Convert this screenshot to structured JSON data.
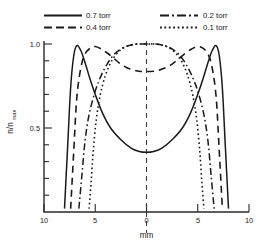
{
  "chart_data": {
    "type": "line",
    "title": "",
    "xlabel": "mm",
    "ylabel": "n/n max",
    "ylabel_main": "n/n",
    "ylabel_sub": "max",
    "xlim": [
      -10,
      10
    ],
    "ylim": [
      0,
      1.08
    ],
    "grid": false,
    "legend_position": "top",
    "x_ticks": [
      -10,
      -5,
      0,
      5,
      10
    ],
    "x_tick_labels": [
      "10",
      "5",
      "0",
      "5",
      "10"
    ],
    "y_ticks": [
      0.5,
      1.0
    ],
    "y_tick_labels": [
      "0.5",
      "1.0"
    ],
    "y_minor_ticks": [
      0.1,
      0.2,
      0.3,
      0.4,
      0.6,
      0.7,
      0.8,
      0.9
    ],
    "center_line_x": 0,
    "series": [
      {
        "name": "0.7 torr",
        "style": "solid",
        "shape": "double-peaked hollow profile",
        "x": [
          -8.0,
          -7.7,
          -7.4,
          -7.1,
          -6.8,
          -6.4,
          -6.0,
          -5.5,
          -5.0,
          -4.3,
          -3.5,
          -2.5,
          -1.5,
          -0.7,
          0.0,
          0.7,
          1.5,
          2.5,
          3.5,
          4.3,
          5.0,
          5.5,
          6.0,
          6.4,
          6.8,
          7.1,
          7.4,
          7.7,
          8.0
        ],
        "y": [
          0.02,
          0.38,
          0.74,
          0.93,
          0.99,
          0.96,
          0.89,
          0.79,
          0.7,
          0.59,
          0.5,
          0.43,
          0.38,
          0.36,
          0.355,
          0.36,
          0.38,
          0.43,
          0.5,
          0.59,
          0.7,
          0.79,
          0.89,
          0.96,
          0.99,
          0.93,
          0.74,
          0.38,
          0.02
        ]
      },
      {
        "name": "0.4 torr",
        "style": "dashed",
        "shape": "double-peaked, broader, shallow central dip",
        "x": [
          -7.4,
          -7.1,
          -6.8,
          -6.4,
          -6.0,
          -5.5,
          -5.0,
          -4.4,
          -3.8,
          -3.2,
          -2.6,
          -2.0,
          -1.3,
          -0.7,
          0.0,
          0.7,
          1.3,
          2.0,
          2.6,
          3.2,
          3.8,
          4.4,
          5.0,
          5.5,
          6.0,
          6.4,
          6.8,
          7.1,
          7.4
        ],
        "y": [
          0.02,
          0.36,
          0.68,
          0.86,
          0.94,
          0.975,
          0.985,
          0.97,
          0.945,
          0.915,
          0.885,
          0.862,
          0.846,
          0.838,
          0.836,
          0.838,
          0.846,
          0.862,
          0.885,
          0.915,
          0.945,
          0.97,
          0.985,
          0.975,
          0.94,
          0.86,
          0.68,
          0.36,
          0.02
        ]
      },
      {
        "name": "0.2 torr",
        "style": "dash-dot",
        "shape": "single broad centered peak",
        "x": [
          -6.6,
          -6.3,
          -6.0,
          -5.6,
          -5.0,
          -4.4,
          -3.8,
          -3.2,
          -2.6,
          -2.0,
          -1.4,
          -0.8,
          0.0,
          0.8,
          1.4,
          2.0,
          2.6,
          3.2,
          3.8,
          4.4,
          5.0,
          5.6,
          6.0,
          6.3,
          6.6
        ],
        "y": [
          0.02,
          0.22,
          0.42,
          0.58,
          0.72,
          0.815,
          0.885,
          0.935,
          0.966,
          0.985,
          0.996,
          1.0,
          1.0,
          1.0,
          0.996,
          0.985,
          0.966,
          0.935,
          0.885,
          0.815,
          0.72,
          0.58,
          0.42,
          0.22,
          0.02
        ]
      },
      {
        "name": "0.1 torr",
        "style": "dotted",
        "shape": "single narrow centered peak",
        "x": [
          -5.6,
          -5.4,
          -5.2,
          -4.9,
          -4.5,
          -4.0,
          -3.5,
          -3.0,
          -2.5,
          -2.0,
          -1.5,
          -1.0,
          -0.5,
          0.0,
          0.5,
          1.0,
          1.5,
          2.0,
          2.5,
          3.0,
          3.5,
          4.0,
          4.5,
          4.9,
          5.2,
          5.4,
          5.6
        ],
        "y": [
          0.02,
          0.18,
          0.36,
          0.55,
          0.7,
          0.815,
          0.888,
          0.935,
          0.966,
          0.984,
          0.994,
          0.999,
          1.0,
          1.0,
          1.0,
          0.999,
          0.994,
          0.984,
          0.966,
          0.935,
          0.888,
          0.815,
          0.7,
          0.55,
          0.36,
          0.18,
          0.02
        ]
      }
    ]
  },
  "legend": {
    "entries": [
      {
        "label": "0.7 torr",
        "style": "solid"
      },
      {
        "label": "0.4 torr",
        "style": "dashed"
      },
      {
        "label": "0.2 torr",
        "style": "dash-dot"
      },
      {
        "label": "0.1 torr",
        "style": "dotted"
      }
    ]
  }
}
